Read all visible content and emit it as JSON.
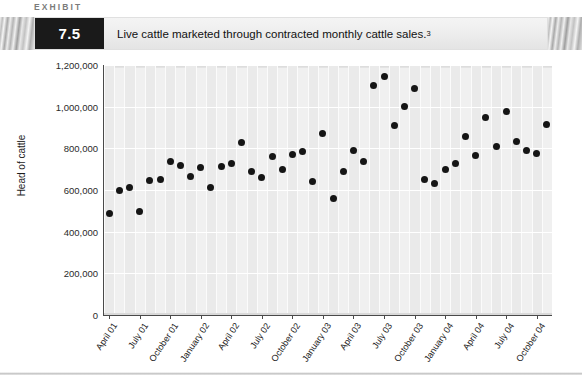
{
  "header": {
    "kicker": "EXHIBIT",
    "number": "7.5",
    "caption": "Live cattle marketed through contracted monthly cattle sales.",
    "caption_footnote": "3"
  },
  "chart_data": {
    "type": "scatter",
    "title": "Live cattle marketed through contracted monthly cattle sales.",
    "xlabel": "",
    "ylabel": "Head of cattle",
    "ylim": [
      0,
      1200000
    ],
    "ytick_labels": [
      "1,200,000",
      "1,000,000",
      "800,000",
      "600,000",
      "400,000",
      "200,000",
      "0"
    ],
    "ytick_values": [
      1200000,
      1000000,
      800000,
      600000,
      400000,
      200000,
      0
    ],
    "grid": true,
    "legend": "none",
    "xtick_labels": [
      "April 01",
      "July 01",
      "October 01",
      "January 02",
      "April 02",
      "July 02",
      "October 02",
      "January 03",
      "April 03",
      "July 03",
      "October 03",
      "January 04",
      "April 04",
      "July 04",
      "October 04"
    ],
    "xtick_indices": [
      0,
      3,
      6,
      9,
      12,
      15,
      18,
      21,
      24,
      27,
      30,
      33,
      36,
      39,
      42
    ],
    "x_start_label": "April 01",
    "x_end_label": "October 04",
    "x_count": 44,
    "points": [
      {
        "i": 0,
        "label": "April 01",
        "value": 485000
      },
      {
        "i": 1,
        "label": "May 01",
        "value": 600000
      },
      {
        "i": 2,
        "label": "June 01",
        "value": 610000
      },
      {
        "i": 3,
        "label": "July 01",
        "value": 495000
      },
      {
        "i": 4,
        "label": "August 01",
        "value": 645000
      },
      {
        "i": 5,
        "label": "September 01",
        "value": 650000
      },
      {
        "i": 6,
        "label": "October 01",
        "value": 735000
      },
      {
        "i": 7,
        "label": "November 01",
        "value": 720000
      },
      {
        "i": 8,
        "label": "December 01",
        "value": 665000
      },
      {
        "i": 9,
        "label": "January 02",
        "value": 710000
      },
      {
        "i": 10,
        "label": "February 02",
        "value": 610000
      },
      {
        "i": 11,
        "label": "March 02",
        "value": 715000
      },
      {
        "i": 12,
        "label": "April 02",
        "value": 725000
      },
      {
        "i": 13,
        "label": "May 02",
        "value": 830000
      },
      {
        "i": 14,
        "label": "June 02",
        "value": 690000
      },
      {
        "i": 15,
        "label": "July 02",
        "value": 660000
      },
      {
        "i": 16,
        "label": "August 02",
        "value": 760000
      },
      {
        "i": 17,
        "label": "September 02",
        "value": 700000
      },
      {
        "i": 18,
        "label": "October 02",
        "value": 770000
      },
      {
        "i": 19,
        "label": "November 02",
        "value": 785000
      },
      {
        "i": 20,
        "label": "December 02",
        "value": 640000
      },
      {
        "i": 21,
        "label": "January 03",
        "value": 870000
      },
      {
        "i": 22,
        "label": "February 03",
        "value": 560000
      },
      {
        "i": 23,
        "label": "March 03",
        "value": 690000
      },
      {
        "i": 24,
        "label": "April 03",
        "value": 790000
      },
      {
        "i": 25,
        "label": "May 03",
        "value": 735000
      },
      {
        "i": 26,
        "label": "June 03",
        "value": 1100000
      },
      {
        "i": 27,
        "label": "July 03",
        "value": 1145000
      },
      {
        "i": 28,
        "label": "August 03",
        "value": 910000
      },
      {
        "i": 29,
        "label": "September 03",
        "value": 1000000
      },
      {
        "i": 30,
        "label": "October 03",
        "value": 1085000
      },
      {
        "i": 31,
        "label": "November 03",
        "value": 650000
      },
      {
        "i": 32,
        "label": "December 03",
        "value": 630000
      },
      {
        "i": 33,
        "label": "January 04",
        "value": 700000
      },
      {
        "i": 34,
        "label": "February 04",
        "value": 725000
      },
      {
        "i": 35,
        "label": "March 04",
        "value": 855000
      },
      {
        "i": 36,
        "label": "April 04",
        "value": 765000
      },
      {
        "i": 37,
        "label": "May 04",
        "value": 950000
      },
      {
        "i": 38,
        "label": "June 04",
        "value": 810000
      },
      {
        "i": 39,
        "label": "July 04",
        "value": 975000
      },
      {
        "i": 40,
        "label": "August 04",
        "value": 835000
      },
      {
        "i": 41,
        "label": "September 04",
        "value": 790000
      },
      {
        "i": 42,
        "label": "October 04",
        "value": 775000
      },
      {
        "i": 43,
        "label": "November 04",
        "value": 915000
      }
    ]
  }
}
